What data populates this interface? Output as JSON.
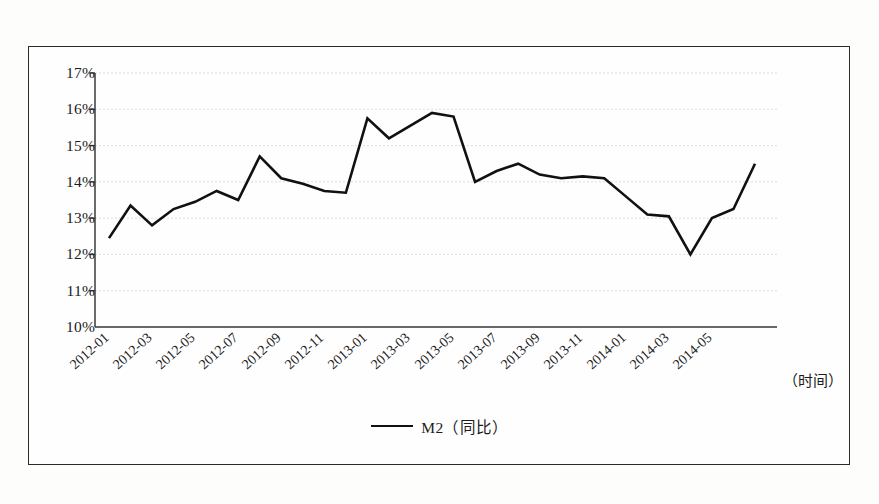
{
  "figure": {
    "legend_label": "M2（同比）",
    "x_axis_title": "（时间）",
    "line_color": "#111111",
    "grid_color": "#cfcfcf",
    "axis_color": "#3a3a3a"
  },
  "chart_data": {
    "type": "line",
    "title": "",
    "xlabel": "（时间）",
    "ylabel": "",
    "ylim": [
      10,
      17
    ],
    "ytick_labels": [
      "17%",
      "16%",
      "15%",
      "14%",
      "13%",
      "12%",
      "11%",
      "10%"
    ],
    "ytick_values": [
      17,
      16,
      15,
      14,
      13,
      12,
      11,
      10
    ],
    "grid": true,
    "legend_position": "bottom-center",
    "series": [
      {
        "name": "M2（同比）",
        "color": "#111111",
        "values": [
          12.45,
          12.9,
          13.35,
          12.8,
          13.2,
          13.45,
          13.75,
          13.5,
          14.7,
          14.1,
          13.95,
          13.75,
          13.7,
          15.75,
          15.2,
          15.55,
          15.9,
          15.8,
          14.0,
          14.3,
          14.5,
          14.2,
          14.1,
          14.15,
          14.1,
          13.6,
          13.1,
          13.05,
          12.0,
          13.0,
          13.25,
          14.5
        ]
      }
    ],
    "x": [
      "2012-01",
      "2012-02",
      "2012-03",
      "2012-04",
      "2012-05",
      "2012-06",
      "2012-07",
      "2012-08",
      "2012-09",
      "2012-10",
      "2012-11",
      "2012-12",
      "2013-01",
      "2013-02",
      "2013-03",
      "2013-04",
      "2013-05",
      "2013-06",
      "2013-07",
      "2013-08",
      "2013-09",
      "2013-10",
      "2013-11",
      "2013-12",
      "2014-01",
      "2014-02",
      "2014-03",
      "2014-04",
      "2014-05",
      "2014-06",
      "2014-07",
      "2014-08"
    ],
    "xtick_labels": [
      "2012-01",
      "2012-03",
      "2012-05",
      "2012-07",
      "2012-09",
      "2012-11",
      "2013-01",
      "2013-03",
      "2013-05",
      "2013-07",
      "2013-09",
      "2013-11",
      "2014-01",
      "2014-03",
      "2014-05"
    ],
    "plot_points": [
      {
        "label": "2012-01",
        "value": 12.45
      },
      {
        "label": "2012-02",
        "value": 13.35
      },
      {
        "label": "2012-03",
        "value": 12.8
      },
      {
        "label": "2012-04",
        "value": 13.25
      },
      {
        "label": "2012-05",
        "value": 13.45
      },
      {
        "label": "2012-06",
        "value": 13.75
      },
      {
        "label": "2012-07",
        "value": 13.5
      },
      {
        "label": "2012-08",
        "value": 14.7
      },
      {
        "label": "2012-09",
        "value": 14.1
      },
      {
        "label": "2012-10",
        "value": 13.95
      },
      {
        "label": "2012-11",
        "value": 13.75
      },
      {
        "label": "2012-12",
        "value": 13.7
      },
      {
        "label": "2013-01",
        "value": 15.75
      },
      {
        "label": "2013-02",
        "value": 15.2
      },
      {
        "label": "2013-03",
        "value": 15.55
      },
      {
        "label": "2013-04",
        "value": 15.9
      },
      {
        "label": "2013-05",
        "value": 15.8
      },
      {
        "label": "2013-06",
        "value": 14.0
      },
      {
        "label": "2013-07",
        "value": 14.3
      },
      {
        "label": "2013-08",
        "value": 14.5
      },
      {
        "label": "2013-09",
        "value": 14.2
      },
      {
        "label": "2013-10",
        "value": 14.1
      },
      {
        "label": "2013-11",
        "value": 14.15
      },
      {
        "label": "2013-12",
        "value": 14.1
      },
      {
        "label": "2014-01",
        "value": 13.6
      },
      {
        "label": "2014-02",
        "value": 13.1
      },
      {
        "label": "2014-03",
        "value": 13.05
      },
      {
        "label": "2014-04",
        "value": 12.0
      },
      {
        "label": "2014-05",
        "value": 13.0
      },
      {
        "label": "2014-06",
        "value": 13.25
      },
      {
        "label": "2014-07",
        "value": 14.5
      }
    ]
  }
}
